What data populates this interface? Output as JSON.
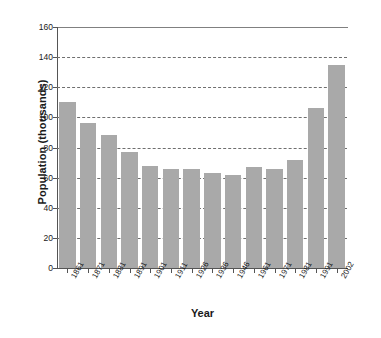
{
  "chart_data": {
    "type": "bar",
    "title": "",
    "xlabel": "Year",
    "ylabel": "Population (thousands)",
    "categories": [
      "1861",
      "1871",
      "1881",
      "1891",
      "1901",
      "1911",
      "1926",
      "1936",
      "1946",
      "1961",
      "1971",
      "1981",
      "1991",
      "2002"
    ],
    "values": [
      110,
      96,
      88,
      77,
      68,
      66,
      66,
      63,
      62,
      67,
      66,
      72,
      106,
      135
    ],
    "ylim": [
      0,
      160
    ],
    "yticks": [
      0,
      20,
      40,
      60,
      80,
      100,
      120,
      140,
      160
    ],
    "ytick_labels": [
      "0",
      "20",
      "40",
      "60",
      "80",
      "100",
      "120",
      "140",
      "160"
    ],
    "grid": "horizontal-dashed",
    "legend": "none",
    "bar_color": "#a9a9a9",
    "axis_color": "#555555",
    "grid_color": "#6f6f6f"
  }
}
